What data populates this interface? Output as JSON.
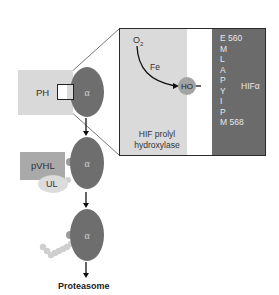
{
  "diagram": {
    "ph_label": "PH",
    "alpha_label": "α",
    "pvhl_label": "pVHL",
    "ul_label": "UL",
    "proteasome_label": "Proteasome",
    "inset": {
      "o2_label": "O",
      "o2_subscript": "2",
      "fe_label": "Fe",
      "ho_label": "HO",
      "enzyme_label_line1": "HIF prolyl",
      "enzyme_label_line2": "hydroxylase",
      "hif_label": "HIFα",
      "sequence": [
        "E 560",
        "M",
        "L",
        "A",
        "P",
        "Y",
        "I",
        "P",
        "M 568"
      ]
    },
    "colors": {
      "alpha_subunit": "#6e6e6e",
      "ph_box": "#d9d9d9",
      "pvhl_box": "#a9a9a9",
      "ul": "#dcdcdc",
      "inset_enzyme_region": "#dadada",
      "inset_hif_region": "#6b6b6b"
    }
  }
}
